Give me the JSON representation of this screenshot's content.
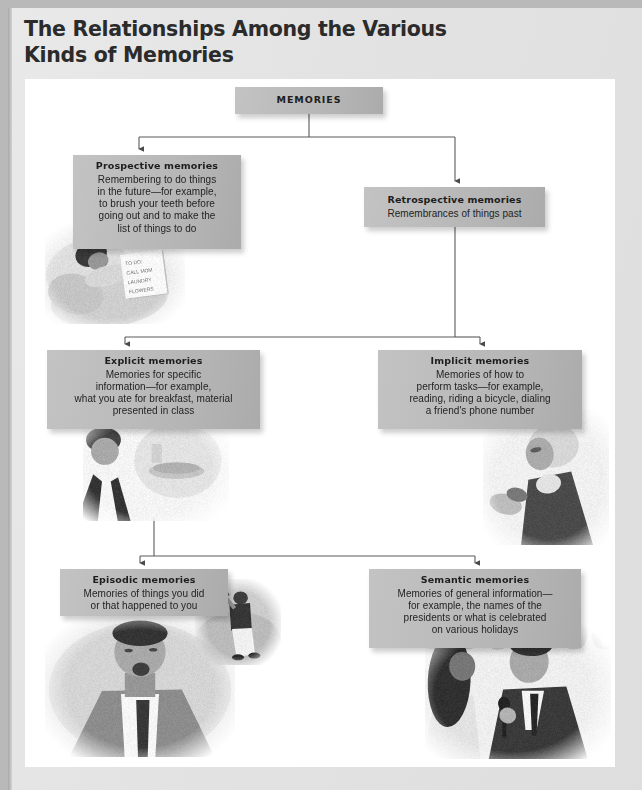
{
  "title": {
    "line1": "The Relationships Among the Various",
    "line2": "Kinds of Memories"
  },
  "colors": {
    "page_background": "#b9b9b9",
    "sheet_background": "#e6e6e6",
    "panel_background": "#ffffff",
    "box_fill": "#bcbcbc",
    "box_text": "#1d1d1d",
    "connector_line": "#555555",
    "title_text": "#2b2b2b"
  },
  "diagram": {
    "type": "hierarchy-flowchart",
    "root": {
      "id": "memories",
      "heading": "MEMORIES",
      "body": ""
    },
    "nodes": [
      {
        "id": "prospective",
        "heading": "Prospective memories",
        "body": "Remembering to do things\nin the future—for example,\nto brush your teeth before\ngoing out and to make the\nlist of things to do",
        "parent": "memories"
      },
      {
        "id": "retrospective",
        "heading": "Retrospective memories",
        "body": "Remembrances of things past",
        "parent": "memories"
      },
      {
        "id": "explicit",
        "heading": "Explicit memories",
        "body": "Memories for specific\ninformation—for example,\nwhat you ate for breakfast, material\npresented in class",
        "parent": "retrospective"
      },
      {
        "id": "implicit",
        "heading": "Implicit memories",
        "body": "Memories of how to\nperform tasks—for example,\nreading, riding a bicycle, dialing\na friend's phone number",
        "parent": "retrospective"
      },
      {
        "id": "episodic",
        "heading": "Episodic memories",
        "body": "Memories of things you did\nor that happened to you",
        "parent": "explicit"
      },
      {
        "id": "semantic",
        "heading": "Semantic memories",
        "body": "Memories of general information—\nfor example, the names of the\npresidents or what is celebrated\non various holidays",
        "parent": "explicit"
      }
    ],
    "photos": [
      {
        "id": "sleeper",
        "caption_semantic": "person-sleeping-in-bed-with-to-do-note",
        "note_text": "TO DO:\nCALL MOM\nLAUNDRY\nFLOWERS"
      },
      {
        "id": "breakfast",
        "caption_semantic": "young-man-and-breakfast-plate"
      },
      {
        "id": "phone",
        "caption_semantic": "woman-dialing-telephone"
      },
      {
        "id": "baseball",
        "caption_semantic": "baseball-batter-swinging"
      },
      {
        "id": "man",
        "caption_semantic": "man-in-suit-portrait"
      },
      {
        "id": "gameshow",
        "caption_semantic": "game-show-host-with-contestant",
        "backdrop_text": "$50,000.00"
      }
    ]
  }
}
